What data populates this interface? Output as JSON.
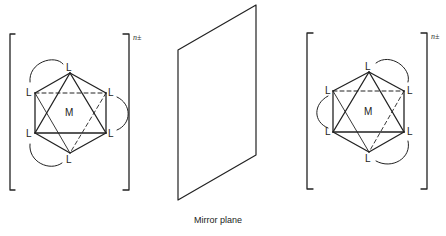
{
  "figure": {
    "caption": "Mirror plane",
    "left_complex": {
      "metal_label": "M",
      "ligand_label": "L",
      "charge": "n±"
    },
    "right_complex": {
      "metal_label": "M",
      "ligand_label": "L",
      "charge": "n±"
    }
  }
}
